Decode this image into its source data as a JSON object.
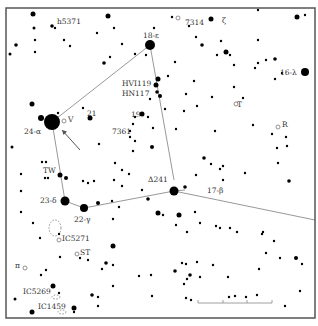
{
  "map": {
    "title": "Lyra star chart",
    "frame": {
      "x": 6,
      "y": 8,
      "width": 309,
      "height": 310
    },
    "colors": {
      "background": "#ffffff",
      "star": "#000000",
      "line": "#999999",
      "frame": "#555555",
      "label": "#333333"
    },
    "constellation_lines": [
      [
        [
          52,
          122
        ],
        [
          150,
          45
        ]
      ],
      [
        [
          150,
          45
        ],
        [
          174,
          180
        ]
      ],
      [
        [
          52,
          122
        ],
        [
          65,
          201
        ]
      ],
      [
        [
          65,
          201
        ],
        [
          84,
          208
        ]
      ],
      [
        [
          84,
          208
        ],
        [
          174,
          191
        ]
      ],
      [
        [
          174,
          191
        ],
        [
          315,
          220
        ]
      ],
      [
        [
          174,
          191
        ],
        [
          185,
          190
        ]
      ]
    ],
    "arrow": {
      "from": [
        80,
        150
      ],
      "to": [
        62,
        130
      ]
    },
    "scale_bar": {
      "x1": 198,
      "x2": 272,
      "y": 303,
      "ticks": [
        198,
        223,
        247,
        272
      ]
    },
    "labels": [
      {
        "id": "h5371",
        "text": "h5371",
        "x": 57,
        "y": 24
      },
      {
        "id": "7314",
        "text": "7314",
        "x": 185,
        "y": 25
      },
      {
        "id": "zeta",
        "text": "ζ",
        "x": 222,
        "y": 23
      },
      {
        "id": "epsilon",
        "text": "18-ε",
        "x": 143,
        "y": 38
      },
      {
        "id": "lambda",
        "text": "16-λ",
        "x": 280,
        "y": 75
      },
      {
        "id": "hv1119",
        "text": "HVI119",
        "x": 122,
        "y": 86
      },
      {
        "id": "hn117",
        "text": "HN117",
        "x": 122,
        "y": 96
      },
      {
        "id": "T",
        "text": "T",
        "x": 237,
        "y": 107
      },
      {
        "id": "21",
        "text": "21",
        "x": 87,
        "y": 116
      },
      {
        "id": "19",
        "text": "19",
        "x": 131,
        "y": 117
      },
      {
        "id": "V",
        "text": "V",
        "x": 68,
        "y": 122
      },
      {
        "id": "R",
        "text": "R",
        "x": 282,
        "y": 127
      },
      {
        "id": "alpha",
        "text": "24-α",
        "x": 24,
        "y": 134
      },
      {
        "id": "7361",
        "text": "7361",
        "x": 112,
        "y": 134
      },
      {
        "id": "TW",
        "text": "TW",
        "x": 43,
        "y": 173
      },
      {
        "id": "delta241",
        "text": "Δ241",
        "x": 148,
        "y": 182
      },
      {
        "id": "beta",
        "text": "17-β",
        "x": 207,
        "y": 193
      },
      {
        "id": "delta",
        "text": "23-δ",
        "x": 40,
        "y": 203
      },
      {
        "id": "gamma",
        "text": "22-γ",
        "x": 74,
        "y": 222
      },
      {
        "id": "ic5271",
        "text": "IC5271",
        "x": 62,
        "y": 241
      },
      {
        "id": "ST",
        "text": "ST",
        "x": 80,
        "y": 255
      },
      {
        "id": "pi",
        "text": "π",
        "x": 15,
        "y": 268
      },
      {
        "id": "ic5269",
        "text": "IC5269",
        "x": 23,
        "y": 294
      },
      {
        "id": "ic1459",
        "text": "IC1459",
        "x": 38,
        "y": 309
      }
    ],
    "stars": [
      [
        52,
        122,
        8
      ],
      [
        150,
        45,
        5
      ],
      [
        65,
        201,
        4.5
      ],
      [
        84,
        208,
        4
      ],
      [
        174,
        191,
        4.5
      ],
      [
        305,
        72,
        4
      ],
      [
        33,
        14,
        2.5
      ],
      [
        108,
        16,
        2.5
      ],
      [
        211,
        19,
        2.5
      ],
      [
        297,
        17,
        2.5
      ],
      [
        52,
        26,
        1.8
      ],
      [
        55,
        28,
        1.2
      ],
      [
        34,
        28,
        1.5
      ],
      [
        16,
        45,
        1.8
      ],
      [
        10,
        54,
        1.5
      ],
      [
        35,
        40,
        1.2
      ],
      [
        35,
        52,
        1.2
      ],
      [
        64,
        40,
        1.2
      ],
      [
        70,
        46,
        1.2
      ],
      [
        97,
        33,
        1.2
      ],
      [
        114,
        28,
        1.2
      ],
      [
        104,
        63,
        1.8
      ],
      [
        110,
        57,
        1.2
      ],
      [
        122,
        44,
        1.2
      ],
      [
        135,
        54,
        1.2
      ],
      [
        146,
        55,
        1.2
      ],
      [
        154,
        28,
        1.2
      ],
      [
        172,
        17,
        1.2
      ],
      [
        189,
        26,
        1.2
      ],
      [
        202,
        45,
        1.8
      ],
      [
        226,
        52,
        2.5
      ],
      [
        230,
        55,
        1.2
      ],
      [
        217,
        55,
        1.2
      ],
      [
        234,
        65,
        1.2
      ],
      [
        255,
        68,
        1.2
      ],
      [
        266,
        60,
        1.2
      ],
      [
        275,
        59,
        1.8
      ],
      [
        282,
        73,
        1.2
      ],
      [
        275,
        79,
        1.2
      ],
      [
        258,
        63,
        1.2
      ],
      [
        234,
        87,
        1.2
      ],
      [
        194,
        81,
        1.2
      ],
      [
        168,
        76,
        1.2
      ],
      [
        175,
        62,
        1.2
      ],
      [
        196,
        37,
        1.2
      ],
      [
        258,
        40,
        1.2
      ],
      [
        221,
        41,
        1.2
      ],
      [
        258,
        10,
        1.2
      ],
      [
        305,
        15,
        1.2
      ],
      [
        150,
        99,
        1.2
      ],
      [
        165,
        109,
        1.2
      ],
      [
        186,
        94,
        1.2
      ],
      [
        212,
        97,
        1.2
      ],
      [
        243,
        98,
        1.2
      ],
      [
        197,
        106,
        1.2
      ],
      [
        157,
        92,
        1.8
      ],
      [
        215,
        131,
        1.2
      ],
      [
        184,
        111,
        1.2
      ],
      [
        176,
        129,
        1.2
      ],
      [
        253,
        125,
        1.2
      ],
      [
        272,
        134,
        1.2
      ],
      [
        286,
        137,
        1.2
      ],
      [
        287,
        146,
        1.2
      ],
      [
        277,
        148,
        1.2
      ],
      [
        278,
        163,
        1.2
      ],
      [
        289,
        181,
        1.8
      ],
      [
        211,
        164,
        1.2
      ],
      [
        204,
        158,
        1.8
      ],
      [
        220,
        169,
        1.2
      ],
      [
        196,
        175,
        1.2
      ],
      [
        223,
        166,
        1.2
      ],
      [
        245,
        173,
        1.2
      ],
      [
        223,
        180,
        1.2
      ],
      [
        185,
        187,
        1.8
      ],
      [
        158,
        79,
        2.5
      ],
      [
        156,
        85,
        2.5
      ],
      [
        160,
        96,
        2
      ],
      [
        142,
        114,
        2.5
      ],
      [
        135,
        117,
        1.2
      ],
      [
        133,
        124,
        1.2
      ],
      [
        130,
        131,
        1.2
      ],
      [
        130,
        137,
        1.2
      ],
      [
        135,
        141,
        1.2
      ],
      [
        148,
        117,
        1.2
      ],
      [
        153,
        128,
        1.2
      ],
      [
        152,
        147,
        2
      ],
      [
        133,
        151,
        1.2
      ],
      [
        122,
        170,
        1.2
      ],
      [
        115,
        163,
        1.2
      ],
      [
        99,
        144,
        1.2
      ],
      [
        90,
        118,
        2.5
      ],
      [
        83,
        108,
        1.2
      ],
      [
        41,
        118,
        3
      ],
      [
        58,
        113,
        1.2
      ],
      [
        32,
        104,
        2.5
      ],
      [
        12,
        147,
        1.5
      ],
      [
        21,
        174,
        1.2
      ],
      [
        42,
        162,
        1.2
      ],
      [
        46,
        162,
        1.2
      ],
      [
        45,
        178,
        1.2
      ],
      [
        48,
        178,
        1.2
      ],
      [
        60,
        175,
        2.5
      ],
      [
        66,
        178,
        2
      ],
      [
        83,
        181,
        1.2
      ],
      [
        88,
        183,
        1.2
      ],
      [
        94,
        181,
        1.2
      ],
      [
        114,
        180,
        1.2
      ],
      [
        122,
        186,
        1.2
      ],
      [
        129,
        174,
        1.2
      ],
      [
        142,
        190,
        1.2
      ],
      [
        148,
        199,
        1.8
      ],
      [
        112,
        201,
        1.2
      ],
      [
        119,
        207,
        1.2
      ],
      [
        98,
        203,
        2
      ],
      [
        113,
        219,
        1.2
      ],
      [
        158,
        213,
        2.5
      ],
      [
        163,
        215,
        1.2
      ],
      [
        179,
        215,
        2.5
      ],
      [
        176,
        225,
        1.2
      ],
      [
        21,
        191,
        1.2
      ],
      [
        21,
        212,
        1.2
      ],
      [
        33,
        223,
        1.2
      ],
      [
        40,
        238,
        1.2
      ],
      [
        59,
        234,
        1.2
      ],
      [
        113,
        246,
        2.5
      ],
      [
        106,
        263,
        1.8
      ],
      [
        113,
        265,
        1.2
      ],
      [
        102,
        269,
        1.2
      ],
      [
        88,
        260,
        1.2
      ],
      [
        80,
        258,
        1.2
      ],
      [
        60,
        257,
        1.2
      ],
      [
        46,
        270,
        1.2
      ],
      [
        53,
        286,
        2.5
      ],
      [
        59,
        293,
        1.2
      ],
      [
        41,
        275,
        1.2
      ],
      [
        15,
        299,
        1.5
      ],
      [
        32,
        312,
        2.5
      ],
      [
        74,
        308,
        2.5
      ],
      [
        74,
        312,
        1.2
      ],
      [
        92,
        295,
        1.8
      ],
      [
        98,
        297,
        1.2
      ],
      [
        113,
        286,
        1.2
      ],
      [
        98,
        306,
        1.2
      ],
      [
        151,
        275,
        1.2
      ],
      [
        139,
        276,
        1.2
      ],
      [
        187,
        279,
        1.2
      ],
      [
        200,
        277,
        1.2
      ],
      [
        228,
        277,
        1.2
      ],
      [
        259,
        269,
        1.2
      ],
      [
        296,
        258,
        2
      ],
      [
        302,
        264,
        1.2
      ],
      [
        280,
        258,
        1.2
      ],
      [
        195,
        212,
        1.2
      ],
      [
        200,
        223,
        1.2
      ],
      [
        216,
        226,
        1.2
      ],
      [
        230,
        228,
        1.2
      ],
      [
        237,
        232,
        1.2
      ],
      [
        263,
        232,
        1.2
      ],
      [
        274,
        241,
        1.2
      ],
      [
        266,
        253,
        1.2
      ],
      [
        262,
        234,
        1.2
      ],
      [
        187,
        232,
        1.2
      ],
      [
        175,
        271,
        1.8
      ],
      [
        190,
        275,
        1.8
      ],
      [
        197,
        262,
        1.2
      ],
      [
        213,
        265,
        1.2
      ],
      [
        220,
        228,
        1.2
      ],
      [
        229,
        297,
        1.2
      ],
      [
        235,
        296,
        1.2
      ],
      [
        246,
        297,
        1.2
      ],
      [
        186,
        298,
        1.2
      ],
      [
        191,
        300,
        1.2
      ],
      [
        257,
        295,
        1.2
      ],
      [
        285,
        306,
        1.2
      ],
      [
        300,
        291,
        1.2
      ],
      [
        152,
        296,
        1.2
      ],
      [
        182,
        263,
        1.2
      ],
      [
        186,
        264,
        1.2
      ],
      [
        184,
        284,
        1.2
      ]
    ],
    "open_markers": [
      [
        236,
        104
      ],
      [
        278,
        127
      ],
      [
        64,
        121
      ],
      [
        59,
        240
      ],
      [
        77,
        254
      ],
      [
        25,
        268
      ],
      [
        178,
        18
      ]
    ],
    "dashed_clusters": [
      {
        "cx": 55,
        "cy": 228,
        "rx": 6,
        "ry": 8
      },
      {
        "cx": 56,
        "cy": 297,
        "rx": 4,
        "ry": 2
      },
      {
        "cx": 62,
        "cy": 312,
        "rx": 4,
        "ry": 2
      }
    ]
  }
}
